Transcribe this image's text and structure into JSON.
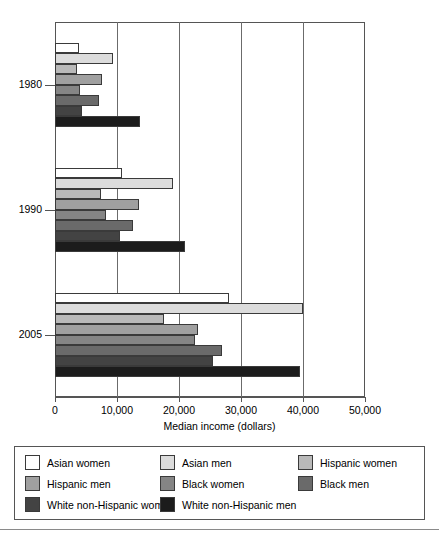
{
  "chart_data": {
    "type": "bar",
    "orientation": "horizontal",
    "title": "",
    "xlabel": "Median income (dollars)",
    "ylabel": "",
    "xlim": [
      0,
      50000
    ],
    "xticks": [
      0,
      10000,
      20000,
      30000,
      40000,
      50000
    ],
    "xtick_labels": [
      "0",
      "10,000",
      "20,000",
      "30,000",
      "40,000",
      "50,000"
    ],
    "grid": true,
    "legend_position": "bottom",
    "categories": [
      "1980",
      "1990",
      "2005"
    ],
    "series": [
      {
        "name": "Asian women",
        "color": "#ffffff",
        "values": [
          3900,
          10800,
          28000
        ]
      },
      {
        "name": "Asian men",
        "color": "#dcdcdc",
        "values": [
          9400,
          19000,
          40000
        ]
      },
      {
        "name": "Hispanic women",
        "color": "#b9b9b9",
        "values": [
          3500,
          7400,
          17500
        ]
      },
      {
        "name": "Hispanic men",
        "color": "#a0a0a0",
        "values": [
          7600,
          13500,
          23000
        ]
      },
      {
        "name": "Black women",
        "color": "#858585",
        "values": [
          4000,
          8200,
          22500
        ]
      },
      {
        "name": "Black men",
        "color": "#6a6a6a",
        "values": [
          7100,
          12600,
          27000
        ]
      },
      {
        "name": "White non-Hispanic women",
        "color": "#434343",
        "values": [
          4300,
          10500,
          25500
        ]
      },
      {
        "name": "White non-Hispanic men",
        "color": "#1c1c1c",
        "values": [
          13700,
          21000,
          39500
        ]
      }
    ]
  },
  "legend": {
    "entries": [
      {
        "label": "Asian women",
        "color": "#ffffff"
      },
      {
        "label": "Asian men",
        "color": "#dcdcdc"
      },
      {
        "label": "Hispanic women",
        "color": "#b9b9b9"
      },
      {
        "label": "Hispanic men",
        "color": "#a0a0a0"
      },
      {
        "label": "Black women",
        "color": "#858585"
      },
      {
        "label": "Black men",
        "color": "#6a6a6a"
      },
      {
        "label": "White non-Hispanic women",
        "color": "#434343"
      },
      {
        "label": "White non-Hispanic men",
        "color": "#1c1c1c"
      }
    ]
  }
}
